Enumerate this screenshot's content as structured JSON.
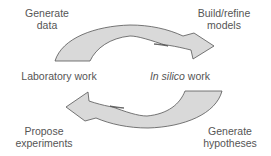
{
  "diagram": {
    "colors": {
      "arrow_fill": "#d9d9d9",
      "arrow_stroke": "#555555",
      "text": "#555555",
      "background": "#ffffff"
    },
    "nodes": {
      "laboratory_work": "Laboratory work",
      "in_silico_italic": "In silico",
      "in_silico_rest": " work"
    },
    "steps": {
      "generate_data": [
        "Generate",
        "data"
      ],
      "build_refine_models": [
        "Build/refine",
        "models"
      ],
      "generate_hypotheses": [
        "Generate",
        "hypotheses"
      ],
      "propose_experiments": [
        "Propose",
        "experiments"
      ]
    },
    "arrows": [
      {
        "from": "Laboratory work",
        "to": "In silico work",
        "position": "top",
        "direction": "clockwise"
      },
      {
        "from": "In silico work",
        "to": "Laboratory work",
        "position": "bottom",
        "direction": "clockwise"
      }
    ]
  }
}
